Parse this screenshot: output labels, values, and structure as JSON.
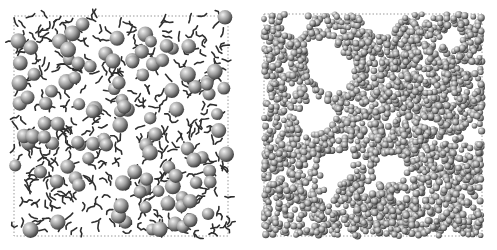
{
  "figure": {
    "panels": [
      {
        "id": "left",
        "description": "Sparse simulation snapshot: large grey spheres dispersed among short dark chain molecules inside a dotted simulation box",
        "box": {
          "x": 14,
          "y": 16,
          "w": 214,
          "h": 220
        },
        "sphere_count": 110,
        "chain_count": 420,
        "sphere_radius": 7,
        "seed": 7
      },
      {
        "id": "right",
        "description": "Dense simulation snapshot: many small grey spheres densely packed with voids, inside a dotted simulation box",
        "box": {
          "x": 14,
          "y": 14,
          "w": 218,
          "h": 222
        },
        "sphere_count": 2600,
        "chain_count": 0,
        "sphere_radius": 3.2,
        "seed": 13
      }
    ],
    "colors": {
      "background": "#ffffff",
      "sphere_light": "#f2f2f2",
      "sphere_mid": "#9a9a9a",
      "sphere_dark": "#3c3c3c",
      "chain": "#2e2e2e",
      "box_border": "#9a9a9a"
    }
  }
}
